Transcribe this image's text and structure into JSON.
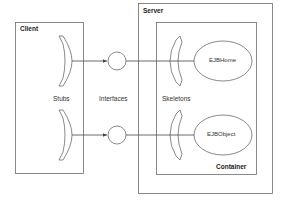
{
  "diagram": {
    "boxes": {
      "client": {
        "label": "Client"
      },
      "server": {
        "label": "Server"
      },
      "container": {
        "label": "Container"
      }
    },
    "column_labels": {
      "stubs": "Stubs",
      "interfaces": "Interfaces",
      "skeletons": "Skeletons"
    },
    "objects": [
      {
        "label": "EJBHome"
      },
      {
        "label": "EJBObject"
      }
    ],
    "colors": {
      "stroke": "#6b6b6b",
      "text": "#333333"
    }
  }
}
